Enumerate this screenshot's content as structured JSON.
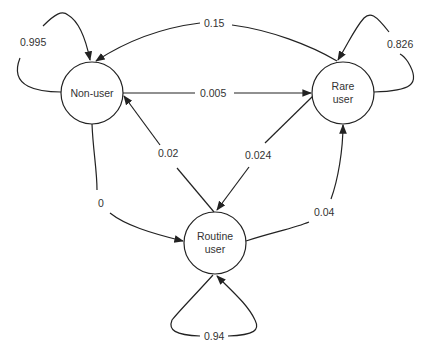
{
  "diagram": {
    "type": "state-transition",
    "nodes": [
      {
        "id": "non_user",
        "label_lines": [
          "Non-user"
        ]
      },
      {
        "id": "rare_user",
        "label_lines": [
          "Rare",
          "user"
        ]
      },
      {
        "id": "routine_user",
        "label_lines": [
          "Routine",
          "user"
        ]
      }
    ],
    "edges": [
      {
        "from": "non_user",
        "to": "non_user",
        "label": "0.995"
      },
      {
        "from": "rare_user",
        "to": "non_user",
        "label": "0.15"
      },
      {
        "from": "rare_user",
        "to": "rare_user",
        "label": "0.826"
      },
      {
        "from": "non_user",
        "to": "rare_user",
        "label": "0.005"
      },
      {
        "from": "routine_user",
        "to": "non_user",
        "label": "0.02"
      },
      {
        "from": "rare_user",
        "to": "routine_user",
        "label": "0.024"
      },
      {
        "from": "non_user",
        "to": "routine_user",
        "label": "0"
      },
      {
        "from": "routine_user",
        "to": "rare_user",
        "label": "0.04"
      },
      {
        "from": "routine_user",
        "to": "routine_user",
        "label": "0.94"
      }
    ]
  }
}
